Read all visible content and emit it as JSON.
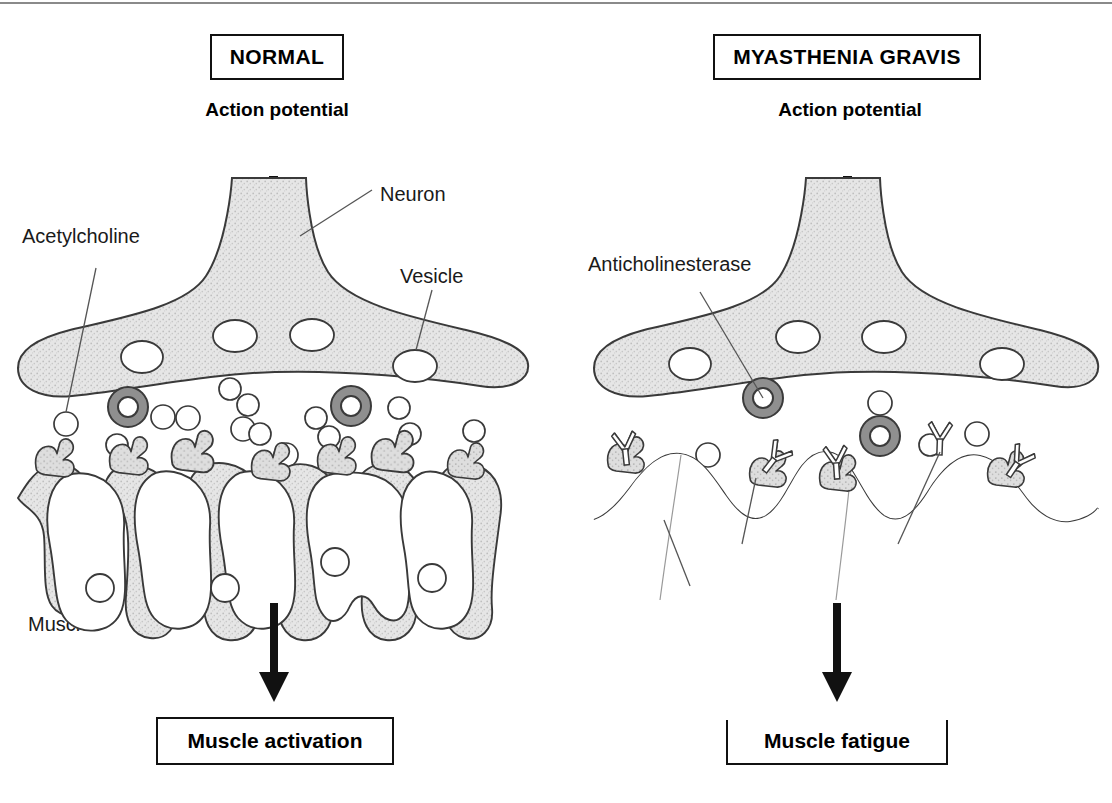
{
  "figure": {
    "title_normal": "NORMAL",
    "title_mg": "MYASTHENIA GRAVIS",
    "colors": {
      "ink": "#1a1a1a",
      "outline": "#3a3a3a",
      "cytoplasm_fill": "#e2e2e2",
      "receptor_fill": "#d6d6d6",
      "enzyme_ring": "#8f8f8f",
      "arrow": "#111111",
      "box_border": "#111111",
      "frame_line": "#8a8a8a"
    }
  },
  "normal_panel": {
    "title": "NORMAL",
    "action_potential": "Action\npotential",
    "labels": {
      "neuron": "Neuron",
      "acetylcholine": "Acetylcholine",
      "vesicle": "Vesicle",
      "muscle": "Muscle"
    },
    "result": "Muscle activation"
  },
  "mg_panel": {
    "title": "MYASTHENIA GRAVIS",
    "action_potential": "Action\npotential",
    "labels": {
      "anticholinesterase": "Anticholinesterase",
      "ach": "ACh",
      "anti_achr": "Anti-AChR",
      "postsynaptic": "Postsynaptic\nmembrane\nsimplified"
    },
    "result": "Muscle fatigue"
  }
}
